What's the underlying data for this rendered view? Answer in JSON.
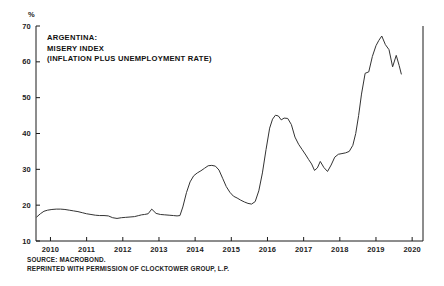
{
  "chart_data": {
    "type": "line",
    "title": "ARGENTINA: MISERY INDEX (INFLATION PLUS UNEMPLOYMENT RATE)",
    "title_lines": [
      "ARGENTINA:",
      "MISERY INDEX",
      "(INFLATION PLUS UNEMPLOYMENT RATE)"
    ],
    "xlabel": "",
    "ylabel": "%",
    "unit": "%",
    "xlim": [
      2009.6,
      2020.3
    ],
    "ylim": [
      10,
      70
    ],
    "ytick_labels": [
      "70",
      "60",
      "50",
      "40",
      "30",
      "20",
      "10"
    ],
    "yticks": [
      70,
      60,
      50,
      40,
      30,
      20,
      10
    ],
    "xtick_labels": [
      "2010",
      "2011",
      "2012",
      "2013",
      "2014",
      "2015",
      "2016",
      "2017",
      "2018",
      "2019",
      "2020"
    ],
    "xticks": [
      2010,
      2011,
      2012,
      2013,
      2014,
      2015,
      2016,
      2017,
      2018,
      2019,
      2020
    ],
    "grid": false,
    "legend": null,
    "line_color": "#333333",
    "series": [
      {
        "name": "Misery Index",
        "x": [
          2009.62,
          2009.72,
          2009.82,
          2009.92,
          2010.04,
          2010.16,
          2010.28,
          2010.4,
          2010.52,
          2010.64,
          2010.76,
          2010.88,
          2011.0,
          2011.12,
          2011.24,
          2011.36,
          2011.48,
          2011.6,
          2011.72,
          2011.84,
          2011.96,
          2012.08,
          2012.2,
          2012.32,
          2012.44,
          2012.52,
          2012.6,
          2012.7,
          2012.8,
          2012.92,
          2013.04,
          2013.16,
          2013.28,
          2013.4,
          2013.5,
          2013.58,
          2013.66,
          2013.76,
          2013.86,
          2013.96,
          2014.06,
          2014.16,
          2014.26,
          2014.36,
          2014.46,
          2014.56,
          2014.66,
          2014.76,
          2014.86,
          2014.96,
          2015.06,
          2015.16,
          2015.26,
          2015.36,
          2015.46,
          2015.56,
          2015.66,
          2015.76,
          2015.86,
          2015.96,
          2016.06,
          2016.14,
          2016.22,
          2016.3,
          2016.38,
          2016.46,
          2016.56,
          2016.66,
          2016.76,
          2016.86,
          2016.96,
          2017.06,
          2017.14,
          2017.22,
          2017.3,
          2017.38,
          2017.46,
          2017.56,
          2017.66,
          2017.76,
          2017.86,
          2017.96,
          2018.06,
          2018.16,
          2018.26,
          2018.36,
          2018.44,
          2018.52,
          2018.6,
          2018.7,
          2018.8,
          2018.9,
          2019.0,
          2019.08,
          2019.16,
          2019.26,
          2019.36,
          2019.46,
          2019.56,
          2019.64,
          2019.7
        ],
        "values": [
          16.7,
          17.6,
          18.3,
          18.6,
          18.8,
          18.9,
          18.9,
          18.8,
          18.6,
          18.4,
          18.2,
          17.9,
          17.6,
          17.4,
          17.2,
          17.1,
          17.1,
          17.0,
          16.5,
          16.3,
          16.5,
          16.6,
          16.7,
          16.8,
          17.1,
          17.3,
          17.4,
          17.6,
          18.9,
          17.7,
          17.4,
          17.3,
          17.2,
          17.1,
          17.0,
          17.1,
          19.5,
          23.5,
          26.5,
          28.2,
          29.0,
          29.6,
          30.3,
          31.0,
          31.1,
          30.9,
          29.8,
          27.5,
          25.2,
          23.6,
          22.5,
          22.0,
          21.4,
          20.9,
          20.5,
          20.3,
          21.0,
          24.0,
          29.0,
          35.5,
          41.5,
          44.0,
          45.1,
          44.9,
          43.8,
          44.3,
          44.2,
          42.5,
          39.0,
          37.0,
          35.5,
          34.0,
          32.7,
          31.5,
          29.7,
          30.4,
          32.2,
          30.5,
          29.4,
          31.2,
          33.4,
          34.2,
          34.4,
          34.6,
          35.0,
          36.7,
          40.0,
          45.0,
          51.0,
          56.8,
          57.2,
          61.5,
          64.5,
          66.0,
          67.2,
          64.8,
          63.4,
          58.6,
          61.8,
          59.0,
          56.6
        ]
      }
    ],
    "annotations": [],
    "notes": [
      "SOURCE: MACROBOND.",
      "REPRINTED WITH PERMISSION OF CLOCKTOWER GROUP, L.P."
    ]
  },
  "footnotes": {
    "source": "SOURCE: MACROBOND.",
    "permission": "REPRINTED WITH PERMISSION OF CLOCKTOWER GROUP, L.P."
  }
}
